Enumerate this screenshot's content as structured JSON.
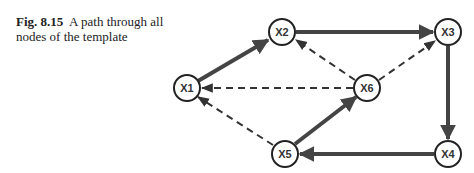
{
  "caption": {
    "figure_number": "Fig. 8.15",
    "text": "A path through all nodes of the template"
  },
  "diagram": {
    "nodes": [
      {
        "id": "X1",
        "label": "X1"
      },
      {
        "id": "X2",
        "label": "X2"
      },
      {
        "id": "X3",
        "label": "X3"
      },
      {
        "id": "X4",
        "label": "X4"
      },
      {
        "id": "X5",
        "label": "X5"
      },
      {
        "id": "X6",
        "label": "X6"
      }
    ],
    "edges": [
      {
        "from": "X1",
        "to": "X2",
        "style": "solid"
      },
      {
        "from": "X2",
        "to": "X3",
        "style": "solid"
      },
      {
        "from": "X3",
        "to": "X4",
        "style": "solid"
      },
      {
        "from": "X4",
        "to": "X5",
        "style": "solid"
      },
      {
        "from": "X5",
        "to": "X6",
        "style": "solid"
      },
      {
        "from": "X6",
        "to": "X1",
        "style": "dashed"
      },
      {
        "from": "X6",
        "to": "X2",
        "style": "dashed"
      },
      {
        "from": "X6",
        "to": "X3",
        "style": "dashed"
      },
      {
        "from": "X5",
        "to": "X1",
        "style": "dashed"
      }
    ],
    "colors": {
      "solid_edge": "#444444",
      "dashed_edge": "#333333",
      "node_stroke": "#222222"
    }
  }
}
